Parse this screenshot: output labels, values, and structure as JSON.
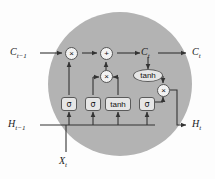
{
  "figure": {
    "type": "lstm-cell-diagram",
    "background_color": "#ffffff",
    "cell_fill_color": "#b3b3b3",
    "node_fill_color": "#f2f2f2",
    "gate_fill_color": "#e6e6e6",
    "line_color": "#333333"
  },
  "inputs": {
    "cell_state_in": "C",
    "cell_state_in_sub": "t−1",
    "hidden_state_in": "H",
    "hidden_state_in_sub": "t−1",
    "input_x": "X",
    "input_x_sub": "t"
  },
  "outputs": {
    "cell_state_mid": "C",
    "cell_state_mid_sub": "t",
    "cell_state_out": "C",
    "cell_state_out_sub": "t",
    "hidden_state_out": "H",
    "hidden_state_out_sub": "t"
  },
  "operators": [
    {
      "id": "forget-multiply",
      "symbol": "×"
    },
    {
      "id": "state-add",
      "symbol": "+"
    },
    {
      "id": "input-multiply",
      "symbol": "×"
    },
    {
      "id": "output-multiply",
      "symbol": "×"
    }
  ],
  "gates": [
    {
      "id": "forget-gate",
      "label": "σ"
    },
    {
      "id": "input-gate",
      "label": "σ"
    },
    {
      "id": "candidate-gate",
      "label": "tanh"
    },
    {
      "id": "output-gate",
      "label": "σ"
    }
  ],
  "activations": [
    {
      "id": "cell-tanh",
      "label": "tanh"
    }
  ]
}
